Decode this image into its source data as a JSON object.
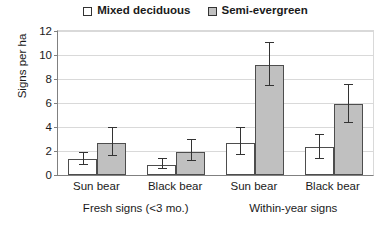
{
  "chart_data": {
    "type": "bar",
    "title": "",
    "xlabel": "",
    "ylabel": "Signs per ha",
    "ylim": [
      0,
      12
    ],
    "yticks": [
      0,
      2,
      4,
      6,
      8,
      10,
      12
    ],
    "grid": true,
    "legend_position": "top-center",
    "categories": [
      "Sun bear",
      "Black bear",
      "Sun bear",
      "Black bear"
    ],
    "group_labels": [
      "Fresh signs (<3 mo.)",
      "Within-year signs"
    ],
    "series": [
      {
        "name": "Mixed deciduous",
        "swatch": "hollow",
        "color": "#ffffff",
        "values": [
          1.3,
          0.85,
          2.7,
          2.3
        ],
        "err_low": [
          0.8,
          0.5,
          1.7,
          1.3
        ],
        "err_high": [
          1.9,
          1.4,
          4.0,
          3.4
        ]
      },
      {
        "name": "Semi-evergreen",
        "swatch": "filled",
        "color": "#c0c0c0",
        "values": [
          2.7,
          1.9,
          9.2,
          5.9
        ],
        "err_low": [
          1.6,
          1.2,
          7.4,
          4.3
        ],
        "err_high": [
          4.0,
          3.0,
          11.1,
          7.6
        ]
      }
    ]
  },
  "legend": {
    "items": [
      {
        "label": "Mixed deciduous",
        "swatch": "hollow"
      },
      {
        "label": "Semi-evergreen",
        "swatch": "filled"
      }
    ]
  },
  "axes": {
    "y_title": "Signs per ha",
    "y_ticks": [
      "0",
      "2",
      "4",
      "6",
      "8",
      "10",
      "12"
    ],
    "x_ticks": [
      "Sun bear",
      "Black bear",
      "Sun bear",
      "Black bear"
    ],
    "x_groups": [
      "Fresh signs (<3 mo.)",
      "Within-year signs"
    ]
  }
}
